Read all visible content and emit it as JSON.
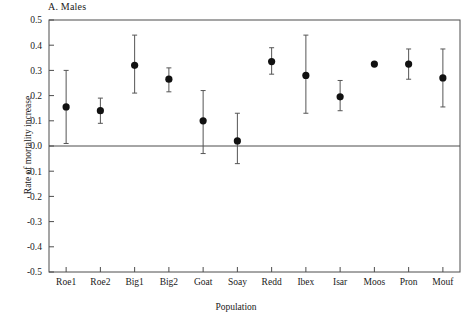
{
  "chart_data": {
    "type": "scatter",
    "title": "A. Males",
    "xlabel": "Population",
    "ylabel": "Rate of mortality increase",
    "categories": [
      "Roe1",
      "Roe2",
      "Big1",
      "Big2",
      "Goat",
      "Soay",
      "Redd",
      "Ibex",
      "Isar",
      "Moos",
      "Pron",
      "Mouf"
    ],
    "values": [
      0.155,
      0.14,
      0.32,
      0.265,
      0.1,
      0.02,
      0.335,
      0.28,
      0.195,
      0.325,
      0.325,
      0.27
    ],
    "error_low": [
      0.01,
      0.09,
      0.21,
      0.215,
      -0.03,
      -0.07,
      0.285,
      0.13,
      0.14,
      0.325,
      0.265,
      0.155
    ],
    "error_high": [
      0.3,
      0.19,
      0.44,
      0.31,
      0.22,
      0.13,
      0.39,
      0.44,
      0.26,
      0.325,
      0.385,
      0.385
    ],
    "ylim": [
      -0.5,
      0.5
    ],
    "yticks": [
      "0.5",
      "0.4",
      "0.3",
      "0.2",
      "0.1",
      "0.0",
      "-0.1",
      "-0.2",
      "-0.3",
      "-0.4",
      "-0.5"
    ],
    "ytick_values": [
      0.5,
      0.4,
      0.3,
      0.2,
      0.1,
      0.0,
      -0.1,
      -0.2,
      -0.3,
      -0.4,
      -0.5
    ],
    "grid": false,
    "legend": "none",
    "zero_line": true,
    "marker": "filled-circle",
    "marker_color": "#111111",
    "errorbar_color": "#555555",
    "axis_color": "#4d4d4d"
  }
}
